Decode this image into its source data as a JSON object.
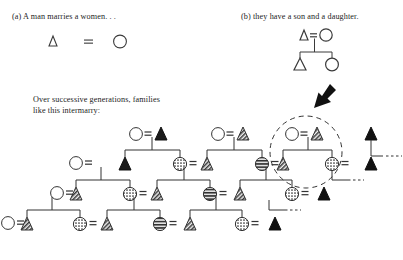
{
  "figure": {
    "kind": "kinship-pedigree-diagram",
    "panels": {
      "a": {
        "label": "(a) A man marries a women. . ."
      },
      "b": {
        "label": "(b) they have a son and a daughter."
      }
    },
    "body_text": {
      "line1": "Over successive generations, families",
      "line2": "like this intermarry:"
    },
    "symbols": {
      "male": "triangle",
      "female": "circle",
      "marriage": "=",
      "descent_line": "vertical-line",
      "sibship_bar": "horizontal-line",
      "continuation": "...",
      "highlight": "dashed-circle",
      "pointer": "black-arrow"
    },
    "legend_notes": {
      "unfilled": "unfilled-outline",
      "dark_fill": "solid-black",
      "dotted_fill": "stippled",
      "striped_fill": "horizontal-stripes",
      "hatch_fill": "diagonal-hatch"
    },
    "colors": {
      "ink": "#1a1a1a",
      "line": "#333333",
      "fill_dark": "#111111",
      "fill_mid": "#555555",
      "fill_light": "#8a8a8a",
      "paper": "#ffffff"
    },
    "panel_a_union": {
      "left": "male",
      "operator": "=",
      "right": "female"
    },
    "panel_b_union": {
      "parents": {
        "left": "male",
        "operator": "=",
        "right": "female"
      },
      "children": [
        "male",
        "female"
      ]
    },
    "generations": [
      {
        "row": 1,
        "nodes": [
          {
            "sex": "female",
            "fill": "unfilled"
          },
          {
            "sex": "male",
            "fill": "dark"
          },
          {
            "sex": "female",
            "fill": "unfilled"
          },
          {
            "sex": "male",
            "fill": "mid"
          },
          {
            "sex": "female",
            "fill": "unfilled"
          },
          {
            "sex": "male",
            "fill": "mid"
          },
          {
            "sex": "male",
            "fill": "dark"
          }
        ]
      },
      {
        "row": 2,
        "nodes": [
          {
            "sex": "female",
            "fill": "unfilled"
          },
          {
            "sex": "male",
            "fill": "dark"
          },
          {
            "sex": "female",
            "fill": "dotted"
          },
          {
            "sex": "male",
            "fill": "mid"
          },
          {
            "sex": "female",
            "fill": "striped"
          },
          {
            "sex": "male",
            "fill": "mid"
          },
          {
            "sex": "female",
            "fill": "dotted"
          },
          {
            "sex": "male",
            "fill": "dark"
          }
        ]
      },
      {
        "row": 3,
        "nodes": [
          {
            "sex": "female",
            "fill": "unfilled"
          },
          {
            "sex": "male",
            "fill": "mid"
          },
          {
            "sex": "female",
            "fill": "dotted"
          },
          {
            "sex": "male",
            "fill": "mid"
          },
          {
            "sex": "female",
            "fill": "striped"
          },
          {
            "sex": "male",
            "fill": "mid"
          },
          {
            "sex": "female",
            "fill": "dotted"
          },
          {
            "sex": "male",
            "fill": "dark"
          }
        ]
      },
      {
        "row": 4,
        "nodes": [
          {
            "sex": "female",
            "fill": "unfilled"
          },
          {
            "sex": "male",
            "fill": "mid"
          },
          {
            "sex": "female",
            "fill": "dotted"
          },
          {
            "sex": "male",
            "fill": "mid"
          },
          {
            "sex": "female",
            "fill": "striped"
          },
          {
            "sex": "male",
            "fill": "mid"
          },
          {
            "sex": "female",
            "fill": "dotted"
          },
          {
            "sex": "male",
            "fill": "dark"
          }
        ]
      }
    ]
  }
}
